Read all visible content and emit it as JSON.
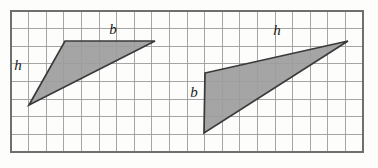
{
  "figure": {
    "background_color": "#fdfdfc",
    "grid": {
      "columns": 20,
      "rows": 8,
      "x0": 11,
      "y0": 11,
      "cell_width": 17.6,
      "cell_height": 17.6,
      "line_color": "#9b9b9b",
      "border_color": "#6f6f6f"
    },
    "shapes": [
      {
        "name": "left-triangle",
        "points": "29,105 65,41 155,41",
        "fill_color": "#9d9d9d",
        "stroke_color": "#3a3a3a"
      },
      {
        "name": "right-triangle",
        "points": "205,73 348,41 204,133",
        "fill_color": "#9d9d9d",
        "stroke_color": "#3a3a3a"
      }
    ],
    "labels": [
      {
        "name": "left-triangle-height-label",
        "text": "h",
        "x": 18,
        "y": 67
      },
      {
        "name": "left-triangle-base-label",
        "text": "b",
        "x": 113,
        "y": 31
      },
      {
        "name": "right-triangle-base-label",
        "text": "b",
        "x": 194,
        "y": 94
      },
      {
        "name": "right-triangle-height-label",
        "text": "h",
        "x": 277,
        "y": 32
      }
    ]
  }
}
